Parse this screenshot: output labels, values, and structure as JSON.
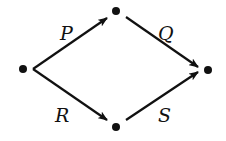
{
  "diagram": {
    "type": "directed-graph",
    "nodes": [
      {
        "id": "start",
        "x": 23,
        "y": 69
      },
      {
        "id": "top",
        "x": 116,
        "y": 11
      },
      {
        "id": "bottom",
        "x": 116,
        "y": 127
      },
      {
        "id": "end",
        "x": 208,
        "y": 70
      }
    ],
    "edges": [
      {
        "from": "start",
        "to": "top",
        "label": "P"
      },
      {
        "from": "top",
        "to": "end",
        "label": "Q"
      },
      {
        "from": "start",
        "to": "bottom",
        "label": "R"
      },
      {
        "from": "bottom",
        "to": "end",
        "label": "S"
      }
    ],
    "labels": {
      "p": "P",
      "q": "Q",
      "r": "R",
      "s": "S"
    },
    "color": "#111111"
  }
}
